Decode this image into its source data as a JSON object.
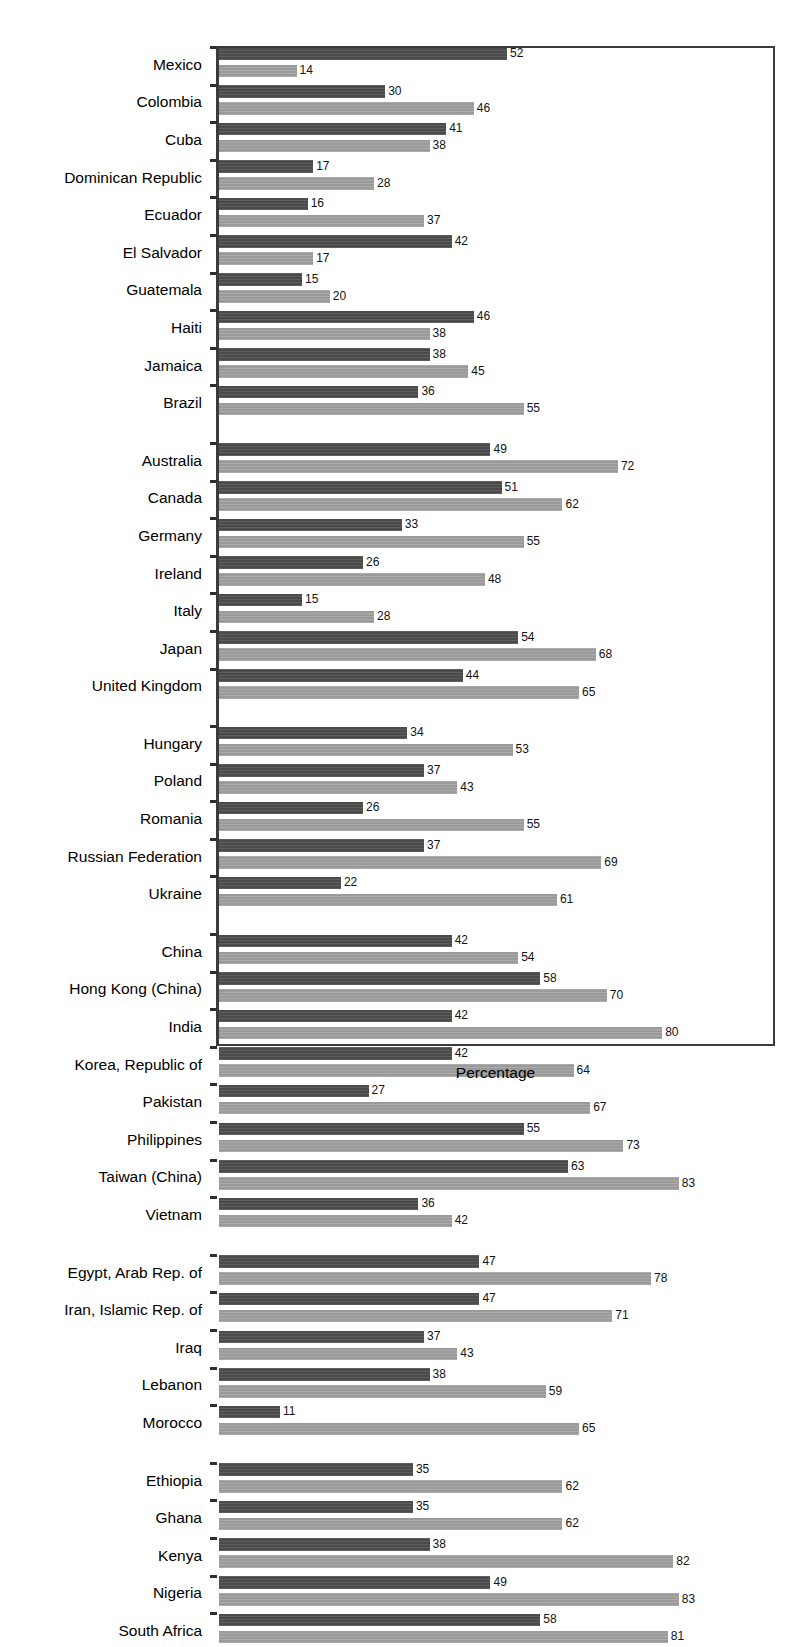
{
  "chart_data": {
    "type": "bar",
    "orientation": "horizontal",
    "title": "",
    "xlabel": "Percentage",
    "ylabel": "",
    "xlim": [
      0,
      100
    ],
    "grid": false,
    "legend_position": "none",
    "series": [
      {
        "name": "dark-series",
        "color": "#4b4b4b"
      },
      {
        "name": "light-series",
        "color": "#9a9a9a"
      }
    ],
    "groups": [
      {
        "name": "Latin America and the Caribbean",
        "rows": [
          {
            "category": "Mexico",
            "dark": 52,
            "light": 14
          },
          {
            "category": "Colombia",
            "dark": 30,
            "light": 46
          },
          {
            "category": "Cuba",
            "dark": 41,
            "light": 38
          },
          {
            "category": "Dominican Republic",
            "dark": 17,
            "light": 28
          },
          {
            "category": "Ecuador",
            "dark": 16,
            "light": 37
          },
          {
            "category": "El Salvador",
            "dark": 42,
            "light": 17
          },
          {
            "category": "Guatemala",
            "dark": 15,
            "light": 20
          },
          {
            "category": "Haiti",
            "dark": 46,
            "light": 38
          },
          {
            "category": "Jamaica",
            "dark": 38,
            "light": 45
          },
          {
            "category": "Brazil",
            "dark": 36,
            "light": 55
          }
        ]
      },
      {
        "name": "High income OECD",
        "rows": [
          {
            "category": "Australia",
            "dark": 49,
            "light": 72
          },
          {
            "category": "Canada",
            "dark": 51,
            "light": 62
          },
          {
            "category": "Germany",
            "dark": 33,
            "light": 55
          },
          {
            "category": "Ireland",
            "dark": 26,
            "light": 48
          },
          {
            "category": "Italy",
            "dark": 15,
            "light": 28
          },
          {
            "category": "Japan",
            "dark": 54,
            "light": 68
          },
          {
            "category": "United Kingdom",
            "dark": 44,
            "light": 65
          }
        ]
      },
      {
        "name": "Europe and Central Asia",
        "rows": [
          {
            "category": "Hungary",
            "dark": 34,
            "light": 53
          },
          {
            "category": "Poland",
            "dark": 37,
            "light": 43
          },
          {
            "category": "Romania",
            "dark": 26,
            "light": 55
          },
          {
            "category": "Russian Federation",
            "dark": 37,
            "light": 69
          },
          {
            "category": "Ukraine",
            "dark": 22,
            "light": 61
          }
        ]
      },
      {
        "name": "Asia",
        "rows": [
          {
            "category": "China",
            "dark": 42,
            "light": 54
          },
          {
            "category": "Hong Kong (China)",
            "dark": 58,
            "light": 70
          },
          {
            "category": "India",
            "dark": 42,
            "light": 80
          },
          {
            "category": "Korea, Republic of",
            "dark": 42,
            "light": 64
          },
          {
            "category": "Pakistan",
            "dark": 27,
            "light": 67
          },
          {
            "category": "Philippines",
            "dark": 55,
            "light": 73
          },
          {
            "category": "Taiwan (China)",
            "dark": 63,
            "light": 83
          },
          {
            "category": "Vietnam",
            "dark": 36,
            "light": 42
          }
        ]
      },
      {
        "name": "Middle East and North Africa",
        "rows": [
          {
            "category": "Egypt, Arab Rep. of",
            "dark": 47,
            "light": 78
          },
          {
            "category": "Iran, Islamic Rep. of",
            "dark": 47,
            "light": 71
          },
          {
            "category": "Iraq",
            "dark": 37,
            "light": 43
          },
          {
            "category": "Lebanon",
            "dark": 38,
            "light": 59
          },
          {
            "category": "Morocco",
            "dark": 11,
            "light": 65
          }
        ]
      },
      {
        "name": "Sub-Saharan Africa",
        "rows": [
          {
            "category": "Ethiopia",
            "dark": 35,
            "light": 62
          },
          {
            "category": "Ghana",
            "dark": 35,
            "light": 62
          },
          {
            "category": "Kenya",
            "dark": 38,
            "light": 82
          },
          {
            "category": "Nigeria",
            "dark": 49,
            "light": 83
          },
          {
            "category": "South Africa",
            "dark": 58,
            "light": 81
          }
        ]
      }
    ]
  },
  "axis": {
    "x_title": "Percentage"
  },
  "colors": {
    "dark_bar": "#4b4b4b",
    "light_bar": "#9a9a9a",
    "frame": "#3b3b3b",
    "text": "#000000"
  }
}
